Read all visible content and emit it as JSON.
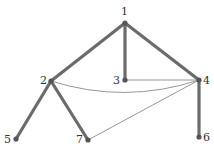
{
  "diagram": {
    "type": "graph",
    "nodes": [
      {
        "id": "1",
        "label": "1",
        "x": 125,
        "y": 23,
        "lx": 121,
        "ly": 15
      },
      {
        "id": "2",
        "label": "2",
        "x": 51,
        "y": 81,
        "lx": 40,
        "ly": 84
      },
      {
        "id": "3",
        "label": "3",
        "x": 125,
        "y": 80,
        "lx": 113,
        "ly": 84
      },
      {
        "id": "4",
        "label": "4",
        "x": 199,
        "y": 80,
        "lx": 203,
        "ly": 84
      },
      {
        "id": "5",
        "label": "5",
        "x": 16,
        "y": 139,
        "lx": 4,
        "ly": 143
      },
      {
        "id": "6",
        "label": "6",
        "x": 199,
        "y": 137,
        "lx": 203,
        "ly": 141
      },
      {
        "id": "7",
        "label": "7",
        "x": 88,
        "y": 140,
        "lx": 76,
        "ly": 143
      }
    ],
    "edges": [
      {
        "from": "1",
        "to": "2",
        "weight": "thick"
      },
      {
        "from": "1",
        "to": "3",
        "weight": "thick"
      },
      {
        "from": "1",
        "to": "4",
        "weight": "thick"
      },
      {
        "from": "2",
        "to": "5",
        "weight": "thick"
      },
      {
        "from": "2",
        "to": "7",
        "weight": "thick"
      },
      {
        "from": "4",
        "to": "6",
        "weight": "thick"
      },
      {
        "from": "3",
        "to": "4",
        "weight": "thin"
      },
      {
        "from": "2",
        "to": "4",
        "weight": "thin",
        "curved": true
      },
      {
        "from": "7",
        "to": "4",
        "weight": "thin"
      }
    ],
    "colors": {
      "thick_edge": "#6b6b6b",
      "thin_edge": "#8a8a8a",
      "node": "#555555",
      "label": "#333333"
    }
  }
}
